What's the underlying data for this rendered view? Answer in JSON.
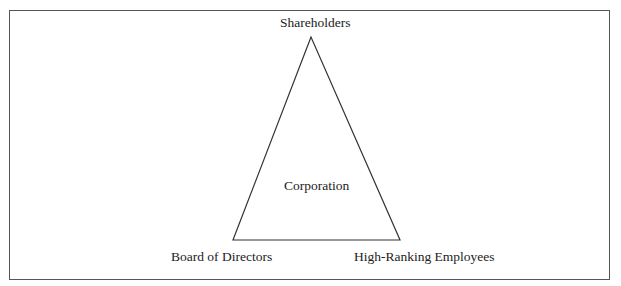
{
  "diagram": {
    "type": "triangle",
    "vertices": {
      "top": "Shareholders",
      "bottom_left": "Board of Directors",
      "bottom_right": "High-Ranking Employees"
    },
    "center": "Corporation"
  }
}
